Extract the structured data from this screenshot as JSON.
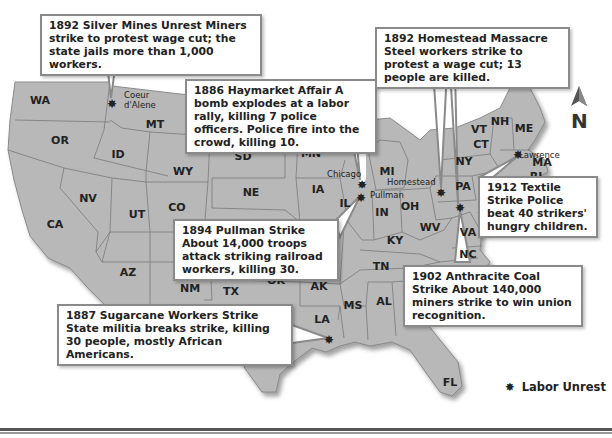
{
  "map": {
    "title": "Labor Unrest in the United States",
    "states": [
      {
        "abbr": "WA",
        "x": 40,
        "y": 104
      },
      {
        "abbr": "OR",
        "x": 60,
        "y": 144
      },
      {
        "abbr": "CA",
        "x": 55,
        "y": 228
      },
      {
        "abbr": "NV",
        "x": 88,
        "y": 202
      },
      {
        "abbr": "ID",
        "x": 118,
        "y": 158
      },
      {
        "abbr": "MT",
        "x": 155,
        "y": 128
      },
      {
        "abbr": "WY",
        "x": 183,
        "y": 175
      },
      {
        "abbr": "UT",
        "x": 137,
        "y": 218
      },
      {
        "abbr": "CO",
        "x": 177,
        "y": 211
      },
      {
        "abbr": "AZ",
        "x": 128,
        "y": 276
      },
      {
        "abbr": "NM",
        "x": 190,
        "y": 292
      },
      {
        "abbr": "SD",
        "x": 243,
        "y": 160
      },
      {
        "abbr": "NE",
        "x": 251,
        "y": 196
      },
      {
        "abbr": "MN",
        "x": 311,
        "y": 157
      },
      {
        "abbr": "WI",
        "x": 339,
        "y": 153
      },
      {
        "abbr": "IA",
        "x": 318,
        "y": 193
      },
      {
        "abbr": "IL",
        "x": 345,
        "y": 207
      },
      {
        "abbr": "MI",
        "x": 387,
        "y": 175
      },
      {
        "abbr": "IN",
        "x": 382,
        "y": 216
      },
      {
        "abbr": "OH",
        "x": 410,
        "y": 210
      },
      {
        "abbr": "KY",
        "x": 395,
        "y": 244
      },
      {
        "abbr": "WV",
        "x": 430,
        "y": 231
      },
      {
        "abbr": "PA",
        "x": 463,
        "y": 190
      },
      {
        "abbr": "NY",
        "x": 464,
        "y": 165
      },
      {
        "abbr": "VT",
        "x": 479,
        "y": 133
      },
      {
        "abbr": "NH",
        "x": 500,
        "y": 125
      },
      {
        "abbr": "ME",
        "x": 524,
        "y": 132
      },
      {
        "abbr": "CT",
        "x": 481,
        "y": 148
      },
      {
        "abbr": "MA",
        "x": 542,
        "y": 166
      },
      {
        "abbr": "RI",
        "x": 536,
        "y": 180
      },
      {
        "abbr": "VA",
        "x": 468,
        "y": 236
      },
      {
        "abbr": "NC",
        "x": 468,
        "y": 258
      },
      {
        "abbr": "TN",
        "x": 381,
        "y": 270
      },
      {
        "abbr": "OK",
        "x": 276,
        "y": 284
      },
      {
        "abbr": "AK",
        "x": 319,
        "y": 290
      },
      {
        "abbr": "TX",
        "x": 231,
        "y": 295
      },
      {
        "abbr": "MS",
        "x": 353,
        "y": 309
      },
      {
        "abbr": "AL",
        "x": 384,
        "y": 305
      },
      {
        "abbr": "LA",
        "x": 322,
        "y": 323
      },
      {
        "abbr": "FL",
        "x": 450,
        "y": 386
      }
    ],
    "cities": [
      {
        "name": "Coeur",
        "x": 124,
        "y": 98
      },
      {
        "name": "d'Alene",
        "x": 124,
        "y": 108
      },
      {
        "name": "Chicago",
        "x": 327,
        "y": 177
      },
      {
        "name": "Pullman",
        "x": 370,
        "y": 198
      },
      {
        "name": "Homestead",
        "x": 387,
        "y": 185
      },
      {
        "name": "Lawrence",
        "x": 519,
        "y": 158
      }
    ],
    "markers": [
      {
        "site": "Coeur d'Alene",
        "x": 112,
        "y": 104
      },
      {
        "site": "Chicago",
        "x": 362,
        "y": 185
      },
      {
        "site": "Pullman",
        "x": 361,
        "y": 198
      },
      {
        "site": "Homestead",
        "x": 441,
        "y": 193
      },
      {
        "site": "Pennsylvania coal",
        "x": 460,
        "y": 208
      },
      {
        "site": "Lawrence",
        "x": 518,
        "y": 155
      },
      {
        "site": "Louisiana sugarcane",
        "x": 329,
        "y": 340
      }
    ]
  },
  "callouts": [
    {
      "id": "silver-mines",
      "text": "1892 Silver Mines Unrest Miners strike to protest wage cut; the state jails more than 1,000 workers."
    },
    {
      "id": "haymarket",
      "text": "1886 Haymarket Affair A bomb explodes at a labor rally, killing 7 police officers. Police fire into the crowd, killing 10."
    },
    {
      "id": "homestead",
      "text": "1892 Homestead Massacre Steel workers strike to protest a wage cut; 13 people are killed."
    },
    {
      "id": "textile",
      "text": "1912 Textile Strike Police beat 40 strikers' hungry children."
    },
    {
      "id": "pullman",
      "text": "1894 Pullman Strike About 14,000 troops attack striking railroad workers, killing 30."
    },
    {
      "id": "anthracite",
      "text": "1902 Anthracite Coal Strike About 140,000 miners strike to win union recognition."
    },
    {
      "id": "sugarcane",
      "text": "1887 Sugarcane Workers Strike State militia breaks strike, killing 30 people, mostly African Americans."
    }
  ],
  "compass": {
    "label": "N"
  },
  "legend": {
    "symbol": "✸",
    "label": "Labor Unrest"
  },
  "colors": {
    "land": "#b8b8b8",
    "border": "#7a7a7a",
    "shadow": "#6e6e6e",
    "text": "#222222"
  }
}
